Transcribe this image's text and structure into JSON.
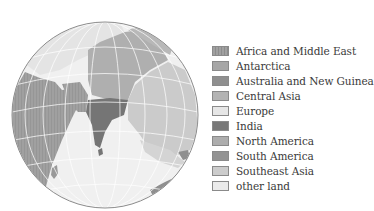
{
  "map": {
    "projection": "orthographic globe",
    "center_region": "India / Indian Ocean",
    "colors": {
      "ocean": "#f0f0f0",
      "graticule": "#ffffff",
      "outline": "#8c8c8c"
    }
  },
  "legend": {
    "items": [
      {
        "label": "Africa and Middle East",
        "color": "#9a9a9a",
        "hatched": true
      },
      {
        "label": "Antarctica",
        "color": "#a6a6a6",
        "hatched": false
      },
      {
        "label": "Australia and New Guinea",
        "color": "#8f8f8f",
        "hatched": false
      },
      {
        "label": "Central Asia",
        "color": "#b3b3b3",
        "hatched": false
      },
      {
        "label": "Europe",
        "color": "#e6e6e6",
        "hatched": false
      },
      {
        "label": "India",
        "color": "#787878",
        "hatched": false
      },
      {
        "label": "North America",
        "color": "#adadad",
        "hatched": false
      },
      {
        "label": "South America",
        "color": "#939393",
        "hatched": false
      },
      {
        "label": "Southeast Asia",
        "color": "#cccccc",
        "hatched": false
      },
      {
        "label": "other land",
        "color": "#ebebeb",
        "hatched": false
      }
    ]
  }
}
